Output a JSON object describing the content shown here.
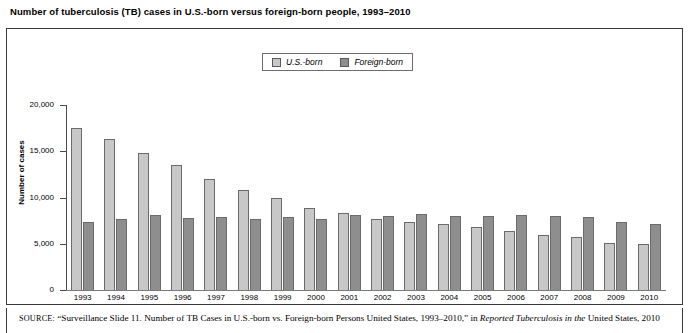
{
  "figure": {
    "title": "Number of tuberculosis (TB) cases in U.S.-born versus foreign-born people, 1993–2010"
  },
  "legend": {
    "position": "top-center",
    "entries": [
      {
        "label": "U.S.-born",
        "color": "#c8c8c8"
      },
      {
        "label": "Foreign-born",
        "color": "#8e8e8e"
      }
    ]
  },
  "axes": {
    "ylabel": "Number of cases",
    "yticks": [
      "0",
      "5,000",
      "10,000",
      "15,000",
      "20,000"
    ],
    "ytick_values": [
      0,
      5000,
      10000,
      15000,
      20000
    ],
    "ylim": [
      0,
      20000
    ]
  },
  "source": {
    "label": "SOURCE:",
    "part1": " “Surveillance Slide 11. Number of TB Cases in U.S.-born vs. Foreign-born Persons United States, 1993–2010,” in ",
    "italic1": "Reported Tuberculosis in the",
    "part2": " United States, 2010"
  },
  "chart_data": {
    "type": "bar",
    "title": "Number of tuberculosis (TB) cases in U.S.-born versus foreign-born people, 1993–2010",
    "xlabel": "",
    "ylabel": "Number of cases",
    "ylim": [
      0,
      20000
    ],
    "grid": false,
    "legend_position": "top-center",
    "categories": [
      "1993",
      "1994",
      "1995",
      "1996",
      "1997",
      "1998",
      "1999",
      "2000",
      "2001",
      "2002",
      "2003",
      "2004",
      "2005",
      "2006",
      "2007",
      "2008",
      "2009",
      "2010"
    ],
    "series": [
      {
        "name": "U.S.-born",
        "color": "#c8c8c8",
        "values": [
          17500,
          16300,
          14800,
          13500,
          12000,
          10800,
          9900,
          8900,
          8300,
          7700,
          7400,
          7100,
          6800,
          6400,
          6000,
          5700,
          5100,
          5000
        ]
      },
      {
        "name": "Foreign-born",
        "color": "#8e8e8e",
        "values": [
          7400,
          7700,
          8100,
          7800,
          7900,
          7700,
          7900,
          7700,
          8100,
          8000,
          8200,
          8000,
          8000,
          8100,
          8000,
          7900,
          7300,
          7100
        ]
      }
    ]
  }
}
